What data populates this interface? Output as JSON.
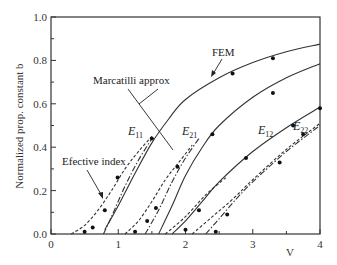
{
  "chart_data": {
    "type": "line",
    "title": "",
    "xlabel": "V",
    "ylabel": "Normalized prop. constant b",
    "xlim": [
      0,
      4
    ],
    "ylim": [
      0.0,
      1.0
    ],
    "x_ticks": [
      "0",
      "1",
      "2",
      "3",
      "4"
    ],
    "y_ticks": [
      "0.0",
      "0.2",
      "0.4",
      "0.6",
      "0.8",
      "1.0"
    ],
    "grid": false,
    "legend": null,
    "annotations": [
      {
        "text": "FEM",
        "points_to": "E11 solid curve near V=2.7"
      },
      {
        "text": "Marcatilli approx",
        "points_to": "E11 and E21 dash-dot curves"
      },
      {
        "text": "Efective index",
        "points_to": "E11 dashed curve near V=0.9"
      }
    ],
    "mode_labels": [
      {
        "main": "E",
        "sub": "11"
      },
      {
        "main": "E",
        "sub": "21"
      },
      {
        "main": "E",
        "sub": "12"
      },
      {
        "main": "E",
        "sub": "22"
      }
    ],
    "series": [
      {
        "name": "E11 FEM",
        "style": "solid",
        "x": [
          0.8,
          1.0,
          1.25,
          1.5,
          1.75,
          2.0,
          2.5,
          3.0,
          3.5,
          4.0
        ],
        "y": [
          0.02,
          0.13,
          0.28,
          0.42,
          0.53,
          0.62,
          0.72,
          0.79,
          0.84,
          0.875
        ]
      },
      {
        "name": "E11 Effective index",
        "style": "dashed",
        "x": [
          0.3,
          0.5,
          0.7,
          0.9,
          1.1,
          1.3,
          1.5
        ],
        "y": [
          0.0,
          0.04,
          0.11,
          0.2,
          0.3,
          0.38,
          0.45
        ]
      },
      {
        "name": "E11 Marcatilli",
        "style": "dashdot",
        "x": [
          0.78,
          0.9,
          1.1,
          1.3,
          1.5
        ],
        "y": [
          0.0,
          0.08,
          0.22,
          0.34,
          0.44
        ]
      },
      {
        "name": "E21 FEM",
        "style": "solid",
        "x": [
          1.6,
          1.8,
          2.0,
          2.25,
          2.5,
          3.0,
          3.5,
          4.0
        ],
        "y": [
          0.0,
          0.13,
          0.27,
          0.4,
          0.5,
          0.63,
          0.72,
          0.785
        ]
      },
      {
        "name": "E21 Effective index",
        "style": "dashed",
        "x": [
          1.1,
          1.3,
          1.5,
          1.7,
          1.9,
          2.1
        ],
        "y": [
          0.0,
          0.06,
          0.15,
          0.25,
          0.33,
          0.41
        ]
      },
      {
        "name": "E21 Marcatilli",
        "style": "dashdot",
        "x": [
          1.4,
          1.6,
          1.8,
          2.0,
          2.2
        ],
        "y": [
          0.0,
          0.11,
          0.24,
          0.35,
          0.44
        ]
      },
      {
        "name": "E12 FEM",
        "style": "solid",
        "x": [
          1.8,
          2.0,
          2.25,
          2.5,
          3.0,
          3.5,
          4.0
        ],
        "y": [
          0.0,
          0.06,
          0.15,
          0.24,
          0.38,
          0.49,
          0.585
        ]
      },
      {
        "name": "E12 Effective index",
        "style": "dashed",
        "x": [
          1.7,
          2.0,
          2.3,
          2.6
        ],
        "y": [
          0.0,
          0.08,
          0.18,
          0.26
        ]
      },
      {
        "name": "E22 FEM",
        "style": "dashdot",
        "x": [
          2.3,
          2.5,
          2.75,
          3.0,
          3.5,
          4.0
        ],
        "y": [
          0.0,
          0.07,
          0.16,
          0.24,
          0.38,
          0.5
        ]
      },
      {
        "name": "E22 Effective index",
        "style": "dashed",
        "x": [
          2.1,
          2.4,
          2.7,
          3.0,
          3.5,
          4.0
        ],
        "y": [
          0.0,
          0.08,
          0.16,
          0.25,
          0.39,
          0.51
        ]
      }
    ],
    "fem_markers": {
      "E11": [
        [
          0.5,
          0.01
        ],
        [
          0.62,
          0.03
        ],
        [
          0.8,
          0.11
        ],
        [
          0.99,
          0.26
        ],
        [
          1.5,
          0.44
        ],
        [
          2.7,
          0.74
        ],
        [
          3.3,
          0.81
        ]
      ],
      "E21": [
        [
          1.25,
          0.01
        ],
        [
          1.43,
          0.06
        ],
        [
          1.56,
          0.12
        ],
        [
          1.88,
          0.31
        ],
        [
          2.4,
          0.46
        ],
        [
          3.3,
          0.65
        ]
      ],
      "E12": [
        [
          2.0,
          0.02
        ],
        [
          2.2,
          0.11
        ],
        [
          2.9,
          0.35
        ],
        [
          3.6,
          0.5
        ],
        [
          4.0,
          0.58
        ]
      ],
      "E22": [
        [
          2.45,
          0.01
        ],
        [
          2.62,
          0.09
        ],
        [
          3.4,
          0.33
        ],
        [
          3.75,
          0.46
        ]
      ]
    }
  }
}
